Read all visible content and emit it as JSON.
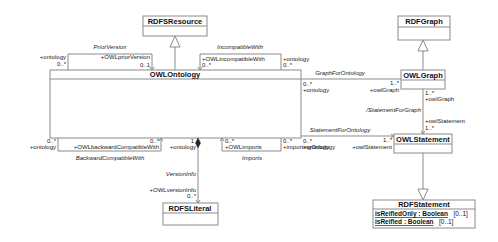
{
  "diagram": {
    "type": "uml-class-diagram",
    "classes": {
      "rdfs_resource": {
        "name": "RDFSResource"
      },
      "owl_ontology": {
        "name": "OWLOntology"
      },
      "rdf_graph": {
        "name": "RDFGraph"
      },
      "owl_graph": {
        "name": "OWLGraph"
      },
      "owl_statement": {
        "name": "OWLStatement"
      },
      "rdfs_literal": {
        "name": "RDFSLiteral"
      },
      "rdf_statement": {
        "name": "RDFStatement",
        "attributes": [
          {
            "name": "isReifiedOnly : Boolean",
            "mult": "[0..1]"
          },
          {
            "name": "isReified : Boolean",
            "mult": "[0..1]"
          }
        ]
      }
    },
    "associations": {
      "prior_version": {
        "name": "PriorVersion",
        "end1_role": "+ontology",
        "end1_mult": "0..*",
        "end2_role": "+OWLpriorVersion",
        "end2_mult": "0..1"
      },
      "incompatible_with": {
        "name": "IncompatibleWith",
        "end1_role": "+OWLincompatibleWith",
        "end1_mult": "0..*",
        "end2_role": "+ontology",
        "end2_mult": "0..*"
      },
      "graph_for_ontology": {
        "name": "GraphForOntology",
        "end1_role": "+ontology",
        "end1_mult": "0..*",
        "end2_role": "+owlGraph",
        "end2_mult": "1..*"
      },
      "statement_for_graph": {
        "name": "/StatementForGraph",
        "end1_role": "+owlGraph",
        "end1_mult": "1..*",
        "end2_role": "+owlStatement",
        "end2_mult": "1..*"
      },
      "statement_for_ontology": {
        "name": "StatementForOntology",
        "end1_role": "+ontology",
        "end1_mult": "0..*",
        "end2_role": "+owlStatement",
        "end2_mult": "1..*"
      },
      "backward_compatible_with": {
        "name": "BackwardCompatibleWith",
        "end1_role": "+ontology",
        "end1_mult": "0..*",
        "end2_role": "+OWLbackwardCompatibleWith",
        "end2_mult": "0..*"
      },
      "version_info": {
        "name": "VersionInfo",
        "end1_role": "+ontology",
        "end1_mult": "1",
        "end2_role": "+OWLversionInfo",
        "end2_mult": "0..*"
      },
      "imports": {
        "name": "Imports",
        "end1_role": "+OWLimports",
        "end1_mult": "0..*",
        "end2_role": "+importingOntology",
        "end2_mult": "0..*"
      }
    }
  }
}
